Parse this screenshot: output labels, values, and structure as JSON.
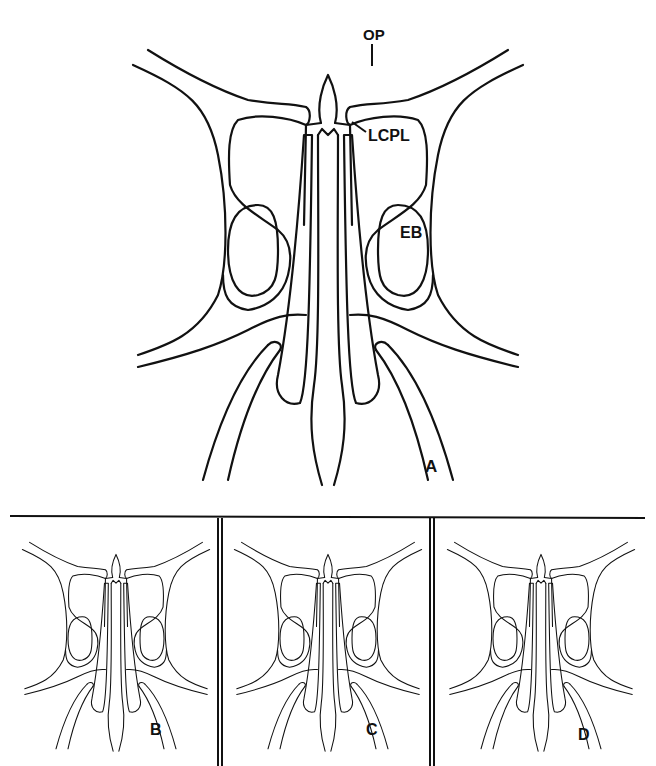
{
  "figure": {
    "main_panel": {
      "letter": "A",
      "labels": {
        "op": "OP",
        "lcpl": "LCPL",
        "eb": "EB"
      }
    },
    "sub_panels": [
      {
        "letter": "B"
      },
      {
        "letter": "C"
      },
      {
        "letter": "D"
      }
    ],
    "line_color": "#111111",
    "background": "#ffffff"
  }
}
